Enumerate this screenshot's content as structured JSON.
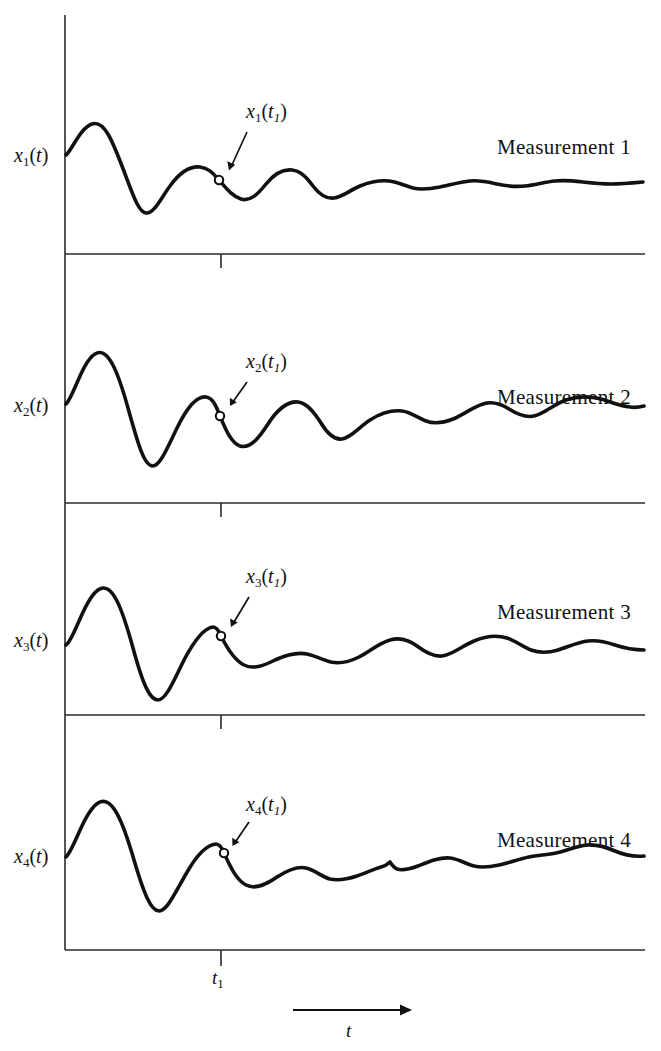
{
  "figure": {
    "axis": {
      "y_axis_x": 65,
      "x_axis_right": 645,
      "top": 15,
      "bottom": 950,
      "tick_x": 221,
      "tick_label": "t",
      "tick_label_sub": "1",
      "time_axis_label": "t",
      "time_axis_arrow": {
        "x1": 293,
        "x2": 412,
        "y": 1010
      }
    },
    "panels": [
      {
        "index": 1,
        "y_label_base": "x",
        "y_label_sub": "1",
        "y_label_arg": "(t)",
        "y_label_top": 144,
        "y_label_left": 14,
        "annotation": "x",
        "annotation_sub": "1",
        "annotation_arg_open": "(",
        "annotation_arg_var": "t",
        "annotation_arg_sub": "1",
        "annotation_arg_close": ")",
        "annotation_left": 246,
        "annotation_top": 100,
        "measurement_label": "Measurement 1",
        "measurement_left": 497,
        "measurement_top": 135,
        "baseline_y": 254,
        "marker": {
          "x": 219,
          "y": 180
        },
        "arrow": {
          "x1": 247,
          "y1": 132,
          "x2": 229,
          "y2": 170
        },
        "curve": "M 66,155 C 72,150 80,128 92,124 C 104,120 112,140 122,166 C 132,192 138,212 146,213 C 154,214 161,198 170,186 C 180,172 190,166 200,167 C 208,168 212,172 219,180 C 226,188 232,196 241,199 C 250,202 258,194 266,184 C 274,174 283,169 292,170 C 301,171 307,178 313,186 C 319,194 326,199 334,198 C 343,197 350,190 360,186 C 370,182 379,180 389,181 C 398,182 405,186 413,188 C 421,190 430,189 440,187 C 450,185 460,182 470,181 C 480,180 488,182 497,184 C 506,186 515,187 525,186 C 535,185 545,182 555,181 C 565,180 574,181 583,182 C 592,183 601,184 611,184 C 621,184 632,183 643,182"
      },
      {
        "index": 2,
        "y_label_base": "x",
        "y_label_sub": "2",
        "y_label_arg": "(t)",
        "y_label_top": 394,
        "y_label_left": 14,
        "annotation": "x",
        "annotation_sub": "2",
        "annotation_arg_open": "(",
        "annotation_arg_var": "t",
        "annotation_arg_sub": "1",
        "annotation_arg_close": ")",
        "annotation_left": 246,
        "annotation_top": 350,
        "measurement_label": "Measurement 2",
        "measurement_left": 497,
        "measurement_top": 385,
        "baseline_y": 503,
        "marker": {
          "x": 220,
          "y": 416
        },
        "arrow": {
          "x1": 247,
          "y1": 382,
          "x2": 230,
          "y2": 406
        },
        "curve": "M 66,404 C 74,396 82,362 95,354 C 108,346 118,372 128,408 C 138,444 144,465 152,466 C 160,467 168,446 178,426 C 189,404 198,396 206,397 C 213,398 216,406 220,416 C 225,428 231,443 240,446 C 250,449 259,438 268,424 C 277,410 288,401 298,402 C 307,403 314,412 321,423 C 327,433 334,440 342,439 C 351,438 359,427 370,420 C 381,413 392,410 402,411 C 411,412 418,418 426,421 C 434,424 443,423 453,419 C 463,415 473,407 483,404 C 492,401 501,404 509,409 C 517,414 525,418 534,416 C 544,414 554,404 566,400 C 578,396 590,396 601,399 C 611,402 620,406 630,407 C 636,408 640,407 644,406"
      },
      {
        "index": 3,
        "y_label_base": "x",
        "y_label_sub": "3",
        "y_label_arg": "(t)",
        "y_label_top": 629,
        "y_label_left": 14,
        "annotation": "x",
        "annotation_sub": "3",
        "annotation_arg_open": "(",
        "annotation_arg_var": "t",
        "annotation_arg_sub": "1",
        "annotation_arg_close": ")",
        "annotation_left": 246,
        "annotation_top": 565,
        "measurement_label": "Measurement 3",
        "measurement_left": 497,
        "measurement_top": 600,
        "baseline_y": 715,
        "marker": {
          "x": 221,
          "y": 636
        },
        "arrow": {
          "x1": 249,
          "y1": 597,
          "x2": 231,
          "y2": 627
        },
        "curve": "M 66,645 C 74,640 84,600 98,590 C 112,580 122,608 133,648 C 143,685 150,700 158,700 C 166,700 174,680 184,660 C 194,641 204,628 213,627 C 217,627 219,631 221,636 C 226,646 234,660 244,665 C 254,670 265,665 275,660 C 286,655 297,652 307,654 C 316,656 323,660 331,662 C 340,664 349,662 359,657 C 369,652 379,643 390,640 C 400,637 409,640 417,646 C 425,652 433,657 442,656 C 452,655 462,646 474,641 C 486,636 497,635 507,638 C 516,641 523,647 531,650 C 539,653 548,653 558,650 C 568,647 578,642 588,641 C 597,640 606,642 615,645 C 624,648 634,650 644,650"
      },
      {
        "index": 4,
        "y_label_base": "x",
        "y_label_sub": "4",
        "y_label_arg": "(t)",
        "y_label_top": 845,
        "y_label_left": 14,
        "annotation": "x",
        "annotation_sub": "4",
        "annotation_arg_open": "(",
        "annotation_arg_var": "t",
        "annotation_arg_sub": "1",
        "annotation_arg_close": ")",
        "annotation_left": 246,
        "annotation_top": 793,
        "measurement_label": "Measurement 4",
        "measurement_left": 497,
        "measurement_top": 828,
        "baseline_y": 950,
        "marker": {
          "x": 224,
          "y": 853
        },
        "arrow": {
          "x1": 249,
          "y1": 822,
          "x2": 233,
          "y2": 846
        },
        "curve": "M 66,857 C 74,850 84,812 98,803 C 112,794 123,822 134,860 C 144,894 151,911 159,911 C 167,911 175,893 186,874 C 196,856 207,845 216,844 C 220,844 222,848 224,853 C 229,864 236,880 246,885 C 256,890 267,884 277,877 C 288,870 297,866 306,868 C 315,870 322,877 330,879 C 339,881 348,879 357,876 C 366,873 374,869 381,867 C 385,866 388,864 390,862 C 392,865 394,868 397,869 C 403,871 410,869 418,866 C 428,862 439,857 450,858 C 459,859 466,864 474,866 C 482,868 490,867 499,865 C 509,863 519,859 529,857 C 538,855 547,855 556,853 C 566,851 576,846 587,845 C 597,844 606,847 615,851 C 624,855 634,857 644,856"
      }
    ]
  }
}
